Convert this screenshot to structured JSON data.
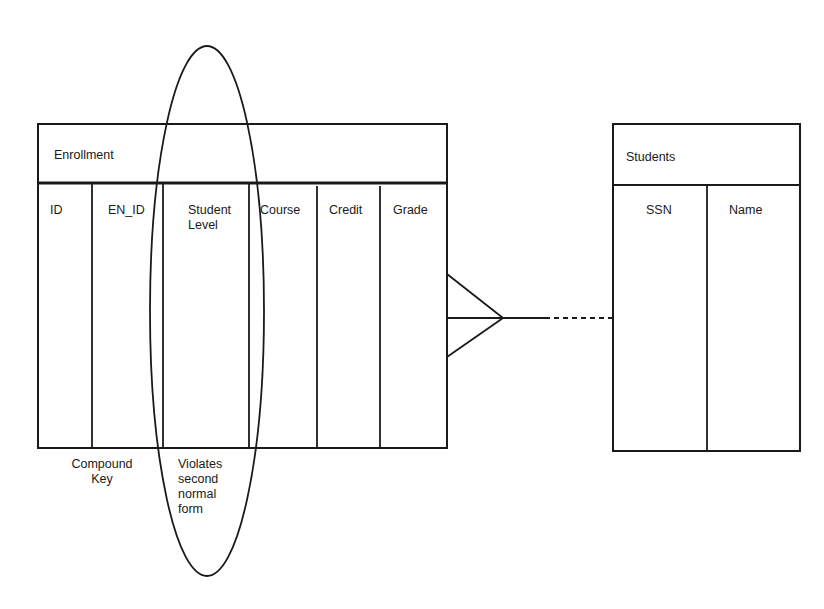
{
  "diagram": {
    "type": "entity-relationship",
    "entities": [
      {
        "name": "Enrollment",
        "columns": [
          "ID",
          "EN_ID",
          "Student\nLevel",
          "Course",
          "Credit",
          "Grade"
        ]
      },
      {
        "name": "Students",
        "columns": [
          "SSN",
          "Name"
        ]
      }
    ],
    "relationship": {
      "from": "Enrollment",
      "to": "Students",
      "from_cardinality": "many (crow's foot)",
      "to_cardinality": "one",
      "line_style": "dashed"
    },
    "annotations": {
      "compound_key": "Compound\nKey",
      "violation": "Violates\nsecond\nnormal\nform"
    },
    "highlight": {
      "shape": "ellipse",
      "encircles_column": "Student Level"
    },
    "colors": {
      "stroke": "#1a1a1a",
      "background": "#ffffff"
    }
  }
}
